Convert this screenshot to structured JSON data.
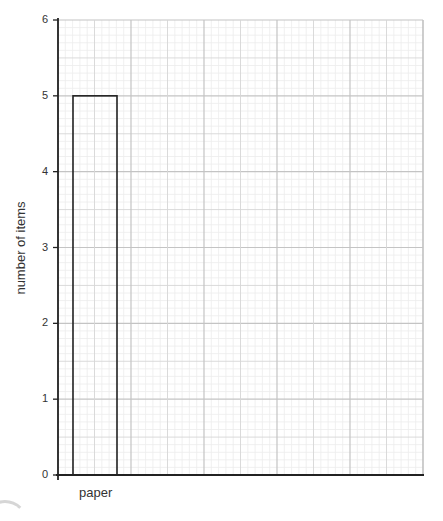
{
  "chart_data": {
    "type": "bar",
    "title": "",
    "xlabel": "",
    "ylabel": "number of items",
    "categories": [
      "paper"
    ],
    "values": [
      5
    ],
    "ylim": [
      0,
      6
    ],
    "yticks": [
      "0",
      "1",
      "2",
      "3",
      "4",
      "5",
      "6"
    ],
    "grid": true,
    "grid_style": "graph paper (major, mid and minor lines)",
    "bar_style": "outline only, no fill",
    "legend": null
  },
  "axis": {
    "ylabel": "number of items",
    "ticks": [
      "0",
      "1",
      "2",
      "3",
      "4",
      "5",
      "6"
    ]
  },
  "categories": [
    "paper"
  ],
  "colors": {
    "axis": "#222222",
    "bar_outline": "#222222",
    "grid_major": "#c4c4c4",
    "grid_minor": "#ececec"
  }
}
